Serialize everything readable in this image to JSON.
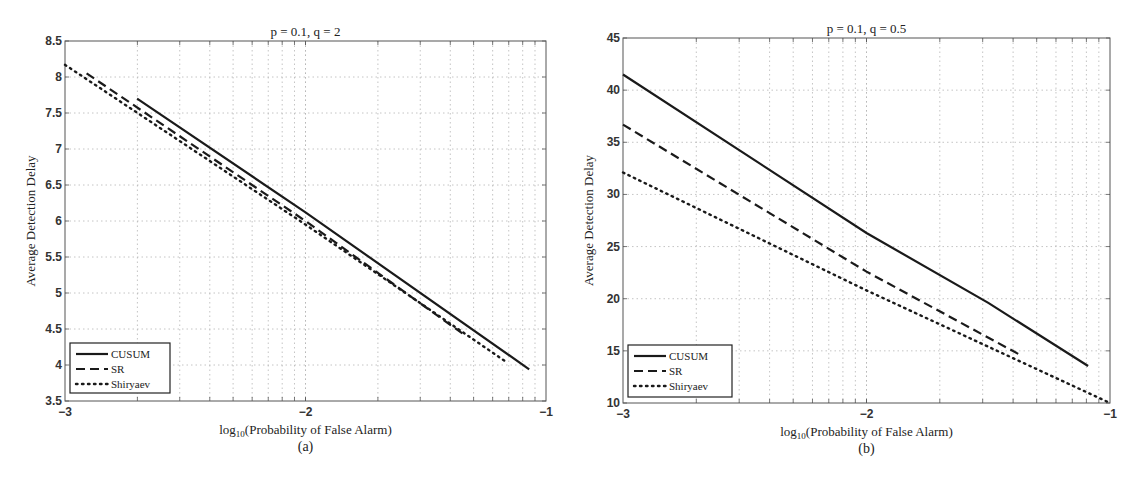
{
  "chart_data": [
    {
      "panel": "(a)",
      "type": "line",
      "title": "p = 0.1, q = 2",
      "xlabel": "log10(Probability of False Alarm)",
      "ylabel": "Average Detection Delay",
      "xscale": "log",
      "xlim": [
        -3,
        -1
      ],
      "ylim": [
        3.5,
        8.5
      ],
      "xticks": [
        "−3",
        "−2",
        "−1"
      ],
      "yticks": [
        "3.5",
        "4",
        "4.5",
        "5",
        "5.5",
        "6",
        "6.5",
        "7",
        "7.5",
        "8",
        "8.5"
      ],
      "grid": true,
      "legend_position": "lower left",
      "series": [
        {
          "name": "CUSUM",
          "style": "solid",
          "x": [
            -2.7,
            -2.0,
            -1.07
          ],
          "y": [
            7.7,
            6.12,
            3.94
          ]
        },
        {
          "name": "SR",
          "style": "dashed",
          "x": [
            -2.91,
            -2.0,
            -1.34
          ],
          "y": [
            8.05,
            6.0,
            4.42
          ]
        },
        {
          "name": "Shiryaev",
          "style": "dotted",
          "x": [
            -3.0,
            -2.0,
            -1.16
          ],
          "y": [
            8.17,
            5.95,
            4.03
          ]
        }
      ]
    },
    {
      "panel": "(b)",
      "type": "line",
      "title": "p = 0.1, q = 0.5",
      "xlabel": "log10(Probability of False Alarm)",
      "ylabel": "Average Detection Delay",
      "xscale": "log",
      "xlim": [
        -3,
        -1
      ],
      "ylim": [
        10,
        45
      ],
      "xticks": [
        "−3",
        "−2",
        "−1"
      ],
      "yticks": [
        "10",
        "15",
        "20",
        "25",
        "30",
        "35",
        "40",
        "45"
      ],
      "grid": true,
      "legend_position": "lower left",
      "series": [
        {
          "name": "CUSUM",
          "style": "solid",
          "x": [
            -3.0,
            -2.0,
            -1.5,
            -1.09
          ],
          "y": [
            41.5,
            26.3,
            19.6,
            13.55
          ]
        },
        {
          "name": "SR",
          "style": "dashed",
          "x": [
            -3.0,
            -2.0,
            -1.36
          ],
          "y": [
            36.7,
            22.6,
            14.5
          ]
        },
        {
          "name": "Shiryaev",
          "style": "dotted",
          "x": [
            -3.0,
            -2.0,
            -1.0
          ],
          "y": [
            32.1,
            20.8,
            10.0
          ]
        }
      ]
    }
  ],
  "panels": [
    {
      "title": "p = 0.1, q = 2",
      "caption": "(a)",
      "xlabel_prefix": "log",
      "xlabel_sub": "10",
      "xlabel_rest": "(Probability of False Alarm)",
      "ylabel": "Average Detection Delay"
    },
    {
      "title": "p = 0.1, q = 0.5",
      "caption": "(b)",
      "xlabel_prefix": "log",
      "xlabel_sub": "10",
      "xlabel_rest": "(Probability of False Alarm)",
      "ylabel": "Average Detection Delay"
    }
  ],
  "legend": [
    "CUSUM",
    "SR",
    "Shiryaev"
  ],
  "colors": {
    "line": "#1a1a1a",
    "grid": "#b5b5b5",
    "axis": "#555555"
  }
}
